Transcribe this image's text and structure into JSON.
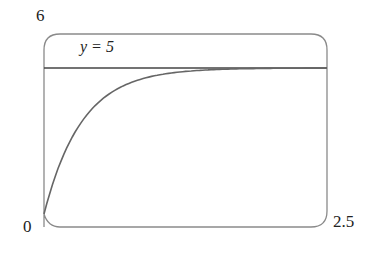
{
  "chart_data": {
    "type": "line",
    "title": "",
    "xlabel": "",
    "ylabel": "",
    "xlim": [
      0,
      2.5
    ],
    "ylim": [
      0,
      6
    ],
    "tick_labels": {
      "x_min": "0",
      "x_max": "2.5",
      "y_max": "6"
    },
    "annotations": [
      {
        "text": "y = 5",
        "type": "horizontal-asymptote",
        "y": 5
      }
    ],
    "series": [
      {
        "name": "curve",
        "x": [
          0,
          0.1,
          0.2,
          0.3,
          0.5,
          0.75,
          1.0,
          1.5,
          2.0,
          2.5
        ],
        "values": [
          0,
          1.3,
          2.26,
          2.97,
          3.88,
          4.47,
          4.75,
          4.94,
          4.99,
          5.0
        ]
      },
      {
        "name": "asymptote",
        "x": [
          0,
          2.5
        ],
        "values": [
          5,
          5
        ]
      }
    ],
    "grid": false,
    "legend": "none"
  },
  "labels": {
    "y_max": "6",
    "origin": "0",
    "x_max": "2.5",
    "asymptote": "y = 5"
  }
}
